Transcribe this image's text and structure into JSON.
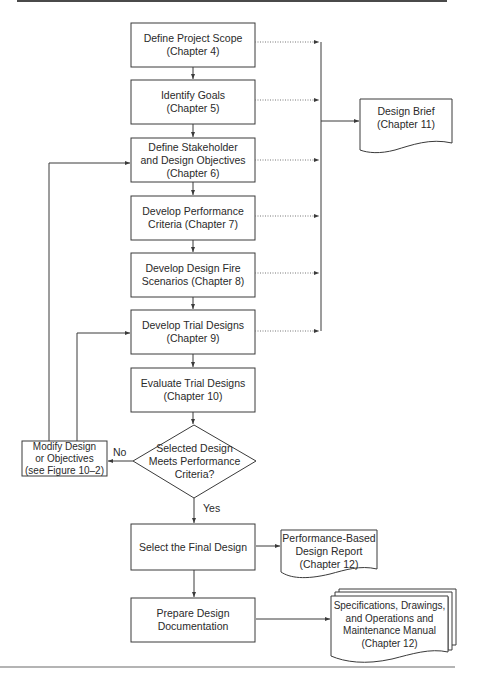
{
  "flowchart": {
    "process_steps": [
      {
        "id": "scope",
        "text": "Define Project Scope\n(Chapter 4)"
      },
      {
        "id": "goals",
        "text": "Identify Goals\n(Chapter 5)"
      },
      {
        "id": "objectives",
        "text": "Define Stakeholder\nand Design Objectives\n(Chapter 6)"
      },
      {
        "id": "criteria",
        "text": "Develop Performance\nCriteria (Chapter 7)"
      },
      {
        "id": "scenarios",
        "text": "Develop Design Fire\nScenarios (Chapter 8)"
      },
      {
        "id": "trial",
        "text": "Develop Trial Designs\n(Chapter 9)"
      },
      {
        "id": "evaluate",
        "text": "Evaluate Trial Designs\n(Chapter 10)"
      },
      {
        "id": "select",
        "text": "Select the Final Design"
      },
      {
        "id": "prepare",
        "text": "Prepare Design\nDocumentation"
      }
    ],
    "decision": {
      "id": "meets",
      "text": "Selected Design\nMeets Performance\nCriteria?"
    },
    "modify": {
      "id": "modify",
      "text": "Modify Design\nor Objectives\n(see Figure 10–2)"
    },
    "documents": {
      "design_brief": "Design Brief\n(Chapter 11)",
      "report": "Performance-Based\nDesign Report\n(Chapter 12)",
      "specs": "Specifications, Drawings,\nand Operations and\nMaintenance Manual\n(Chapter 12)"
    },
    "edge_labels": {
      "no": "No",
      "yes": "Yes"
    }
  },
  "colors": {
    "stroke": "#3a3a3a",
    "dotted": "#777777",
    "text": "#2a2a2a",
    "background": "#ffffff"
  }
}
